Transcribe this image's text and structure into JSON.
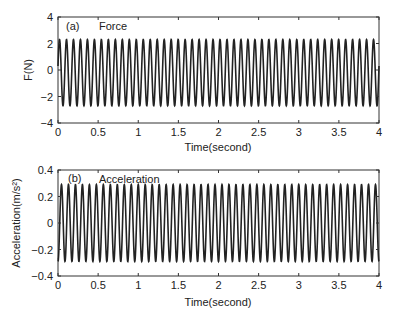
{
  "chart_data": [
    {
      "type": "line",
      "panel": "(a)",
      "title": "Force",
      "xlabel": "Time(second)",
      "ylabel": "F(N)",
      "xlim": [
        0,
        4
      ],
      "ylim": [
        -4,
        4
      ],
      "xticks": [
        "0",
        "0.5",
        "1",
        "1.5",
        "2",
        "2.5",
        "3",
        "3.5",
        "4"
      ],
      "yticks": [
        "4",
        "2",
        "0",
        "-2",
        "-4"
      ],
      "grid": false,
      "series": [
        {
          "name": "Force",
          "description": "sinusoid, ~11.5 Hz",
          "frequency_hz": 11.5,
          "amplitude": 2.5,
          "offset": -0.2,
          "max": 2.3,
          "min": -2.7
        }
      ]
    },
    {
      "type": "line",
      "panel": "(b)",
      "title": "Acceleration",
      "xlabel": "Time(second)",
      "ylabel": "Acceleration(m/s²)",
      "xlim": [
        0,
        4
      ],
      "ylim": [
        -0.4,
        0.4
      ],
      "xticks": [
        "0",
        "0.5",
        "1",
        "1.5",
        "2",
        "2.5",
        "3",
        "3.5",
        "4"
      ],
      "yticks": [
        "0.4",
        "0.2",
        "0",
        "-0.2",
        "-0.4"
      ],
      "grid": false,
      "series": [
        {
          "name": "Acceleration",
          "description": "sinusoid, ~11.5 Hz",
          "frequency_hz": 11.5,
          "amplitude": 0.29,
          "offset": 0,
          "max": 0.29,
          "min": -0.29
        }
      ]
    }
  ],
  "panels": {
    "a": {
      "tag": "(a)",
      "title": "Force",
      "ylabel": "F(N)",
      "xlabel": "Time(second)"
    },
    "b": {
      "tag": "(b)",
      "title": "Acceleration",
      "ylabel": "Acceleration(m/s²)",
      "xlabel": "Time(second)"
    }
  }
}
